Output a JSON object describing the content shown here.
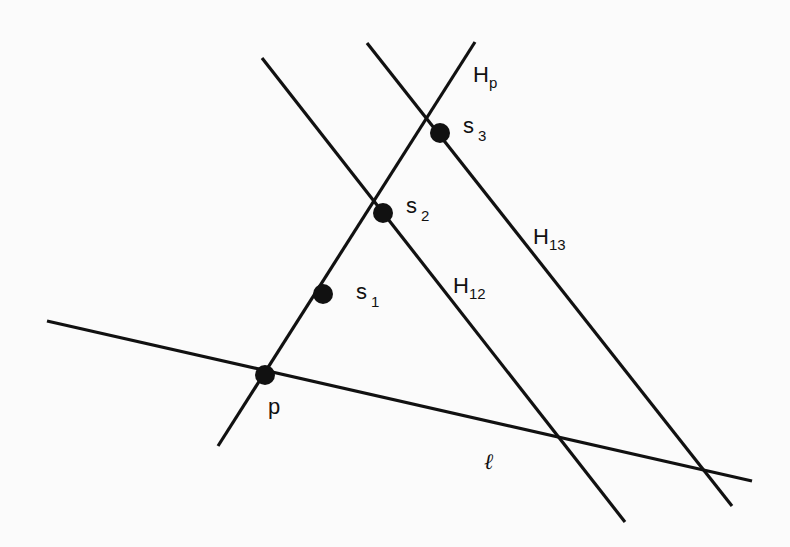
{
  "diagram": {
    "type": "geometric-construction",
    "lines": [
      {
        "id": "l",
        "label": "ℓ",
        "from": [
          47,
          321
        ],
        "to": [
          752,
          481
        ]
      },
      {
        "id": "Hp",
        "label_main": "H",
        "label_sub": "p",
        "from": [
          218,
          446
        ],
        "to": [
          475,
          42
        ]
      },
      {
        "id": "H12",
        "label_main": "H",
        "label_sub": "12",
        "from": [
          262,
          58
        ],
        "to": [
          625,
          522
        ]
      },
      {
        "id": "H13",
        "label_main": "H",
        "label_sub": "13",
        "from": [
          367,
          43
        ],
        "to": [
          732,
          506
        ]
      }
    ],
    "points": [
      {
        "id": "p",
        "label_main": "p",
        "label_sub": "",
        "at": [
          265,
          375
        ]
      },
      {
        "id": "s1",
        "label_main": "s",
        "label_sub": "1",
        "at": [
          323,
          294
        ]
      },
      {
        "id": "s2",
        "label_main": "s",
        "label_sub": "2",
        "at": [
          383,
          213
        ]
      },
      {
        "id": "s3",
        "label_main": "s",
        "label_sub": "3",
        "at": [
          440,
          133
        ]
      }
    ],
    "labels": {
      "Hp_main": "H",
      "Hp_sub": "p",
      "H12_main": "H",
      "H12_sub": "12",
      "H13_main": "H",
      "H13_sub": "13",
      "l": "ℓ",
      "p": "p",
      "s1_main": "s",
      "s1_sub": "1",
      "s2_main": "s",
      "s2_sub": "2",
      "s3_main": "s",
      "s3_sub": "3"
    },
    "colors": {
      "ink": "#111111",
      "paper": "#fbfbfb"
    }
  }
}
